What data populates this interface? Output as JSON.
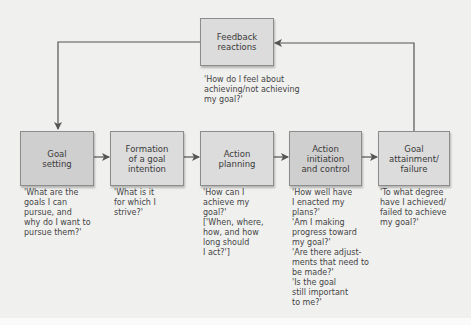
{
  "diagram": {
    "feedback": {
      "label": "Feedback\nreactions",
      "question": "'How do I feel about\nachieving/not achieving\nmy goal?'"
    },
    "stages": [
      {
        "label": "Goal\nsetting",
        "question": "'What are the\ngoals I can\npursue, and\nwhy do I want to\npursue them?'"
      },
      {
        "label": "Formation\nof a goal\nintention",
        "question": "'What is it\nfor which I\nstrive?'"
      },
      {
        "label": "Action\nplanning",
        "question": "'How can I\nachieve my\ngoal?'\n['When, where,\nhow, and how\nlong should\nI act?']"
      },
      {
        "label": "Action\ninitiation\nand control",
        "question": "'How well have\nI enacted my\nplans?'\n'Am I making\nprogress toward\nmy goal?'\n'Are there adjust-\nments that need to\nbe made?'\n'Is the goal\nstill important\nto me?'"
      },
      {
        "label": "Goal\nattainment/\nfailure",
        "question": "'To what degree\nhave I achieved/\nfailed to achieve\nmy goal?'"
      }
    ],
    "colors": {
      "box_light": "#dcdcdc",
      "box_dark": "#cfcfcf",
      "line": "#555555",
      "background": "#f0f0ef"
    }
  }
}
